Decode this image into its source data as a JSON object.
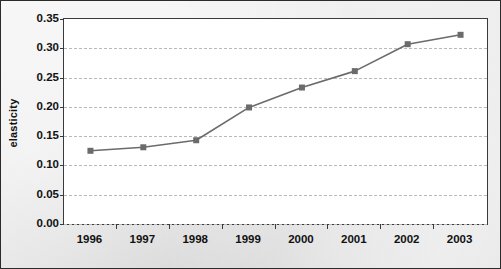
{
  "chart_data": {
    "type": "line",
    "title": "",
    "subtitle": "",
    "xlabel": "",
    "ylabel": "elasticity",
    "categories": [
      "1996",
      "1997",
      "1998",
      "1999",
      "2000",
      "2001",
      "2002",
      "2003"
    ],
    "values": [
      0.125,
      0.131,
      0.143,
      0.199,
      0.233,
      0.261,
      0.307,
      0.323
    ],
    "series": [
      {
        "name": "elasticity",
        "values": [
          0.125,
          0.131,
          0.143,
          0.199,
          0.233,
          0.261,
          0.307,
          0.323
        ]
      }
    ],
    "ylim": [
      0.0,
      0.35
    ],
    "y_ticks": [
      0.0,
      0.05,
      0.1,
      0.15,
      0.2,
      0.25,
      0.3,
      0.35
    ],
    "y_tick_labels": [
      "0.00",
      "0.05",
      "0.10",
      "0.15",
      "0.20",
      "0.25",
      "0.30",
      "0.35"
    ],
    "x_tick_labels": [
      "1996",
      "1997",
      "1998",
      "1999",
      "2000",
      "2001",
      "2002",
      "2003"
    ],
    "grid": "horizontal-dashed",
    "legend": "none",
    "marker": "square",
    "colors": {
      "line": "#6b6b6b",
      "marker": "#6b6b6b",
      "gridline": "#b9b9b9",
      "axis": "#3a3a3a",
      "text": "#111111",
      "plot_background": "#ffffff",
      "figure_background": "#e9e9e9"
    }
  }
}
